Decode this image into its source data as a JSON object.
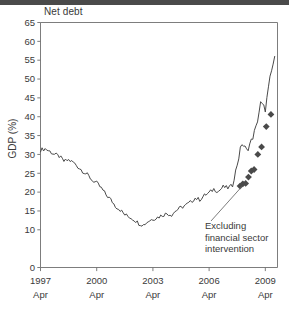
{
  "chart_data": {
    "type": "line",
    "title": "Net debt",
    "xlabel": "",
    "ylabel": "GDP (%)",
    "ylim": [
      0,
      65
    ],
    "ytick_step": 5,
    "yticks": [
      "0",
      "10",
      "15",
      "20",
      "25",
      "30",
      "35",
      "40",
      "45",
      "50",
      "55",
      "60",
      "65"
    ],
    "ytick_values": [
      0,
      10,
      15,
      20,
      25,
      30,
      35,
      40,
      45,
      50,
      55,
      60,
      65
    ],
    "xlim": [
      1997.25,
      2009.9
    ],
    "xticks": [
      {
        "value": 1997.25,
        "line1": "1997",
        "line2": "Apr"
      },
      {
        "value": 2000.25,
        "line1": "2000",
        "line2": "Apr"
      },
      {
        "value": 2003.25,
        "line1": "2003",
        "line2": "Apr"
      },
      {
        "value": 2006.25,
        "line1": "2006",
        "line2": "Apr"
      },
      {
        "value": 2009.25,
        "line1": "2009",
        "line2": "Apr"
      }
    ],
    "grid": false,
    "legend": "none",
    "line_color": "#4a4a4a",
    "marker_color": "#4a4a4a",
    "annotations": [
      {
        "name": "excluding-financial-sector-intervention",
        "lines": [
          "Excluding",
          "financial sector",
          "intervention"
        ],
        "text": "Excluding financial sector intervention",
        "anchor_x": 2008.0,
        "anchor_y": 21.5
      }
    ],
    "series": [
      {
        "name": "Net debt (% of GDP)",
        "style": "line",
        "x": [
          1997.25,
          1997.5,
          1997.75,
          1998.0,
          1998.25,
          1998.5,
          1998.75,
          1999.0,
          1999.25,
          1999.5,
          1999.75,
          2000.0,
          2000.25,
          2000.5,
          2000.75,
          2001.0,
          2001.25,
          2001.5,
          2001.75,
          2002.0,
          2002.25,
          2002.5,
          2002.75,
          2003.0,
          2003.25,
          2003.5,
          2003.75,
          2004.0,
          2004.25,
          2004.5,
          2004.75,
          2005.0,
          2005.25,
          2005.5,
          2005.75,
          2006.0,
          2006.25,
          2006.5,
          2006.75,
          2007.0,
          2007.25,
          2007.5,
          2007.75,
          2008.0,
          2008.25,
          2008.5,
          2008.75,
          2009.0,
          2009.25,
          2009.5,
          2009.75
        ],
        "y": [
          31.2,
          31.5,
          30.8,
          30.0,
          29.5,
          28.2,
          28.5,
          27.9,
          26.7,
          25.6,
          24.6,
          23.2,
          22.4,
          21.0,
          19.3,
          18.0,
          16.3,
          15.3,
          14.0,
          13.4,
          12.7,
          11.7,
          11.3,
          12.3,
          12.9,
          13.3,
          13.9,
          14.3,
          14.0,
          15.2,
          15.9,
          16.5,
          17.3,
          18.4,
          18.0,
          19.1,
          19.8,
          20.8,
          20.2,
          21.4,
          21.1,
          21.8,
          27.5,
          33.0,
          31.0,
          33.5,
          37.0,
          43.5,
          42.0,
          50.0,
          56.0
        ]
      },
      {
        "name": "Excluding financial sector intervention",
        "style": "markers",
        "marker": "diamond",
        "x": [
          2007.9,
          2008.05,
          2008.2,
          2008.35,
          2008.5,
          2008.65,
          2008.85,
          2009.05,
          2009.3,
          2009.55
        ],
        "y": [
          21.6,
          22.2,
          22.3,
          24.0,
          25.6,
          26.0,
          30.0,
          32.0,
          37.4,
          40.6
        ]
      }
    ]
  }
}
